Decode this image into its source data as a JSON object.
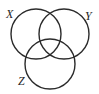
{
  "figure": {
    "background_color": "#ffffff",
    "stroke_color": "#2b2b2b",
    "label_color": "#1f1f1f",
    "stroke_width": 1.4,
    "width": 99,
    "height": 94
  },
  "labels": {
    "x": "X",
    "y": "Y",
    "z": "Z"
  },
  "chart_data": {
    "type": "diagram",
    "subtype": "venn-3-set",
    "sets": [
      {
        "name": "X",
        "label": "X",
        "cx": 36,
        "cy": 34,
        "r": 25,
        "label_x": 6,
        "label_y": 18
      },
      {
        "name": "Y",
        "label": "Y",
        "cx": 64,
        "cy": 34,
        "r": 25,
        "label_x": 85,
        "label_y": 20
      },
      {
        "name": "Z",
        "label": "Z",
        "cx": 50,
        "cy": 64,
        "r": 25,
        "label_x": 18,
        "label_y": 85
      }
    ],
    "regions": [
      "X",
      "Y",
      "Z",
      "X∩Y",
      "X∩Z",
      "Y∩Z",
      "X∩Y∩Z"
    ],
    "shaded_regions": [],
    "legend": "none",
    "grid": false
  }
}
